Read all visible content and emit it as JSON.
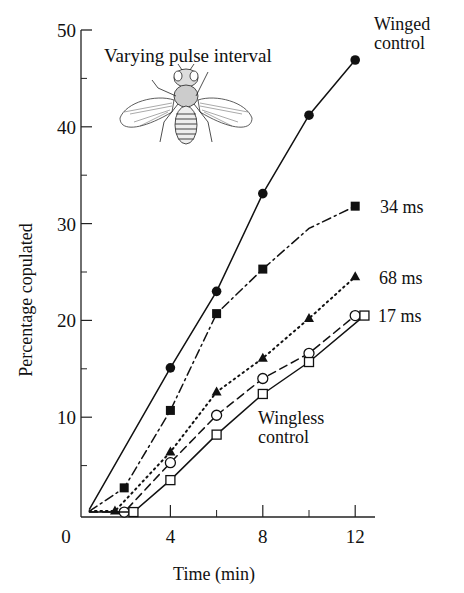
{
  "chart_data": {
    "type": "line",
    "title": "Varying pulse interval",
    "xlabel": "Time (min)",
    "ylabel": "Percentage copulated",
    "xlim": [
      0,
      12.5
    ],
    "ylim": [
      0,
      50
    ],
    "x_ticks": [
      {
        "value": 0,
        "label": "0"
      },
      {
        "value": 4,
        "label": "4"
      },
      {
        "value": 8,
        "label": "8"
      },
      {
        "value": 12,
        "label": "12"
      }
    ],
    "x_minor_ticks": [
      2,
      6,
      10
    ],
    "y_ticks": [
      {
        "value": 10,
        "label": "10"
      },
      {
        "value": 20,
        "label": "20"
      },
      {
        "value": 30,
        "label": "30"
      },
      {
        "value": 40,
        "label": "40"
      },
      {
        "value": 50,
        "label": "50"
      }
    ],
    "y_minor_ticks": [
      5,
      15,
      25,
      35,
      45
    ],
    "grid": false,
    "legend": "inline labels at line ends",
    "series": [
      {
        "name": "Winged control",
        "label_lines": [
          "Winged",
          "control"
        ],
        "marker": "filled-circle",
        "line": "solid",
        "points": [
          [
            0.5,
            0.5
          ],
          [
            4,
            15.1
          ],
          [
            6,
            23.0
          ],
          [
            8,
            33.1
          ],
          [
            10,
            41.2
          ],
          [
            12,
            46.9
          ]
        ],
        "markers": [
          [
            4,
            15.1
          ],
          [
            6,
            23.0
          ],
          [
            8,
            33.1
          ],
          [
            10,
            41.2
          ],
          [
            12,
            46.9
          ]
        ]
      },
      {
        "name": "34 ms",
        "label_lines": [
          "34 ms"
        ],
        "marker": "filled-square",
        "line": "dash-dot",
        "points": [
          [
            0.5,
            0.3
          ],
          [
            2,
            2.7
          ],
          [
            4,
            10.7
          ],
          [
            6,
            20.7
          ],
          [
            8,
            25.3
          ],
          [
            10,
            29.5
          ],
          [
            12,
            31.8
          ]
        ],
        "markers": [
          [
            2,
            2.7
          ],
          [
            4,
            10.7
          ],
          [
            6,
            20.7
          ],
          [
            8,
            25.3
          ],
          [
            12,
            31.8
          ]
        ]
      },
      {
        "name": "68 ms",
        "label_lines": [
          "68 ms"
        ],
        "marker": "filled-triangle",
        "line": "dotted",
        "points": [
          [
            0.5,
            0.3
          ],
          [
            1.6,
            0.3
          ],
          [
            4,
            6.4
          ],
          [
            6,
            12.6
          ],
          [
            8,
            16.1
          ],
          [
            10,
            20.2
          ],
          [
            12,
            24.5
          ]
        ],
        "markers": [
          [
            1.6,
            0.3
          ],
          [
            4,
            6.4
          ],
          [
            6,
            12.6
          ],
          [
            8,
            16.1
          ],
          [
            10,
            20.2
          ],
          [
            12,
            24.5
          ]
        ]
      },
      {
        "name": "17 ms",
        "label_lines": [
          "17 ms"
        ],
        "marker": "open-circle",
        "line": "dashed",
        "points": [
          [
            0.5,
            0.2
          ],
          [
            2,
            0.2
          ],
          [
            4,
            5.3
          ],
          [
            6,
            10.2
          ],
          [
            8,
            14.0
          ],
          [
            10,
            16.6
          ],
          [
            12,
            20.5
          ]
        ],
        "markers": [
          [
            2,
            0.2
          ],
          [
            4,
            5.3
          ],
          [
            6,
            10.2
          ],
          [
            8,
            14.0
          ],
          [
            10,
            16.6
          ],
          [
            12,
            20.5
          ]
        ]
      },
      {
        "name": "Wingless control",
        "label_lines": [
          "Wingless",
          "control"
        ],
        "marker": "open-square",
        "line": "solid",
        "points": [
          [
            0.5,
            0.2
          ],
          [
            2.4,
            0.2
          ],
          [
            4,
            3.5
          ],
          [
            6,
            8.2
          ],
          [
            8,
            12.4
          ],
          [
            10,
            15.7
          ],
          [
            12.4,
            20.5
          ]
        ],
        "markers": [
          [
            2.4,
            0.2
          ],
          [
            4,
            3.5
          ],
          [
            6,
            8.2
          ],
          [
            8,
            12.4
          ],
          [
            10,
            15.7
          ],
          [
            12.4,
            20.5
          ]
        ]
      }
    ],
    "annotations": [
      "Varying pulse interval",
      "Drosophila fly illustration (winged)"
    ]
  }
}
